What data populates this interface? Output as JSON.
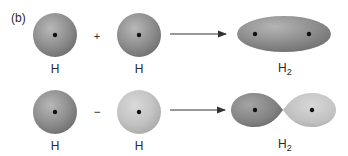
{
  "panel_label": "(b)",
  "rows": [
    {
      "name": "bonding",
      "operator": "+",
      "atoms": [
        {
          "label": "H",
          "shade": "dark"
        },
        {
          "label": "H",
          "shade": "dark"
        }
      ],
      "product": {
        "label": "H",
        "subscript": "2",
        "shape": "ellipse"
      }
    },
    {
      "name": "antibonding",
      "operator": "−",
      "atoms": [
        {
          "label": "H",
          "shade": "dark"
        },
        {
          "label": "H",
          "shade": "light"
        }
      ],
      "product": {
        "label": "H",
        "subscript": "2",
        "shape": "two-lobes"
      }
    }
  ],
  "colors": {
    "dark_sphere": "#8a8a8a",
    "light_sphere": "#c4c4c4",
    "nucleus": "#111111",
    "arrow": "#333333",
    "text": "#2a2a2a"
  }
}
